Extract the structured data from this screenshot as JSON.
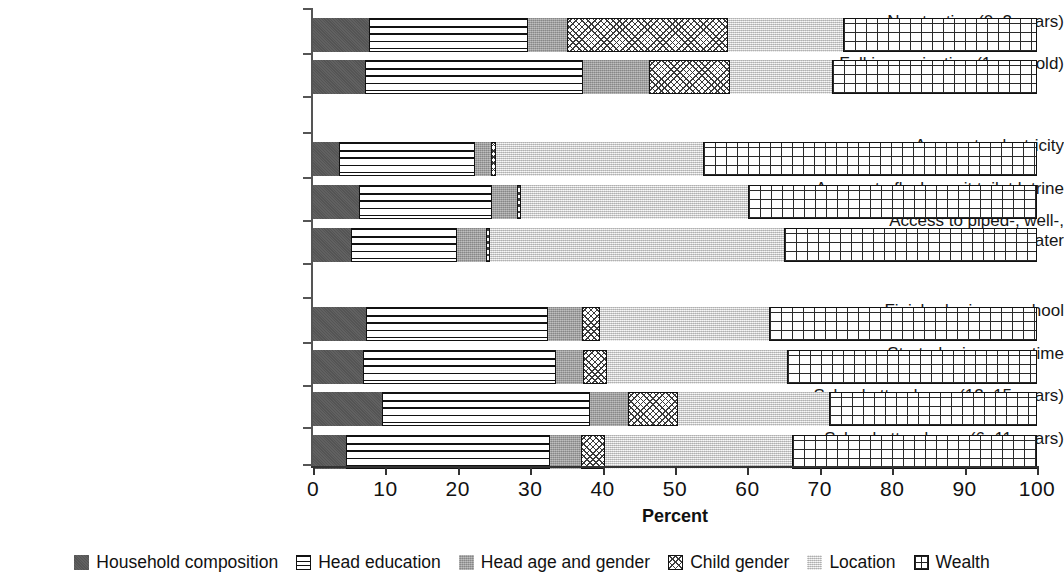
{
  "chart_data": {
    "type": "bar",
    "orientation": "horizontal",
    "stacked": true,
    "title": "",
    "xlabel": "Percent",
    "ylabel": "",
    "xlim": [
      0,
      100
    ],
    "xticks": [
      "0",
      "10",
      "20",
      "30",
      "40",
      "50",
      "60",
      "70",
      "80",
      "90",
      "100"
    ],
    "grid": false,
    "legend_position": "bottom",
    "series": [
      {
        "name": "Household composition",
        "pattern": "solid-dark-gray",
        "color": "#595959",
        "values": [
          7.7,
          7.2,
          3.6,
          6.4,
          5.2,
          7.3,
          6.9,
          9.5,
          4.6
        ]
      },
      {
        "name": "Head education",
        "pattern": "horizontal-lines",
        "color": "#ffffff",
        "values": [
          22.0,
          30.1,
          18.8,
          18.3,
          14.7,
          25.2,
          26.7,
          28.8,
          28.1
        ]
      },
      {
        "name": "Head age and gender",
        "pattern": "medium-gray",
        "color": "#a3a3a3",
        "values": [
          5.4,
          9.1,
          2.2,
          3.5,
          4.0,
          4.7,
          3.7,
          5.2,
          4.3
        ]
      },
      {
        "name": "Child gender",
        "pattern": "cross-hatch",
        "color": "#ffffff",
        "values": [
          22.2,
          11.2,
          0.7,
          0.5,
          0.5,
          2.4,
          3.3,
          6.9,
          3.3
        ]
      },
      {
        "name": "Location",
        "pattern": "light-stipple",
        "color": "#dedede",
        "values": [
          15.9,
          14.1,
          28.6,
          31.4,
          40.6,
          23.4,
          24.9,
          20.9,
          25.8
        ]
      },
      {
        "name": "Wealth",
        "pattern": "grid",
        "color": "#ffffff",
        "values": [
          26.8,
          28.3,
          46.1,
          39.9,
          35.0,
          37.0,
          34.5,
          28.7,
          33.9
        ]
      }
    ],
    "categories": [
      "No stunting (0–2 years)",
      "Full immunization (1-year-old)",
      "Access to electricity",
      "Access to flush or pit toilet latrine",
      "Access to piped-, well-,\nor rainwater",
      "Finished primary school",
      "Started primary on time",
      "School attendance (12–15 years)",
      "School attendance (6–11 years)"
    ],
    "category_groups": [
      {
        "name": "health",
        "indices": [
          0,
          1
        ]
      },
      {
        "name": "infrastructure",
        "indices": [
          2,
          3,
          4
        ]
      },
      {
        "name": "education",
        "indices": [
          5,
          6,
          7,
          8
        ]
      }
    ]
  },
  "axis": {
    "xlabel": "Percent",
    "ticks": [
      "0",
      "10",
      "20",
      "30",
      "40",
      "50",
      "60",
      "70",
      "80",
      "90",
      "100"
    ]
  },
  "legend": {
    "items": [
      {
        "label": "Household composition",
        "swatch": "household-swatch"
      },
      {
        "label": "Head education",
        "swatch": "head-education-swatch"
      },
      {
        "label": "Head age and gender",
        "swatch": "head-age-gender-swatch"
      },
      {
        "label": "Child gender",
        "swatch": "child-gender-swatch"
      },
      {
        "label": "Location",
        "swatch": "location-swatch"
      },
      {
        "label": "Wealth",
        "swatch": "wealth-swatch"
      }
    ]
  },
  "rows": [
    {
      "label": "No stunting (0–2 years)",
      "top": 10,
      "height": 34
    },
    {
      "label": "Full immunization (1-year-old)",
      "top": 52,
      "height": 34
    },
    {
      "label": "Access to electricity",
      "top": 134,
      "height": 34
    },
    {
      "label": "Access to flush or pit toilet latrine",
      "top": 177,
      "height": 34
    },
    {
      "label": "Access to piped-, well-,\nor rainwater",
      "top": 220,
      "height": 34
    },
    {
      "label": "Finished primary school",
      "top": 299,
      "height": 34
    },
    {
      "label": "Started primary on time",
      "top": 342,
      "height": 34
    },
    {
      "label": "School attendance (12–15 years)",
      "top": 384,
      "height": 34
    },
    {
      "label": "School attendance (6–11 years)",
      "top": 427,
      "height": 34
    }
  ]
}
